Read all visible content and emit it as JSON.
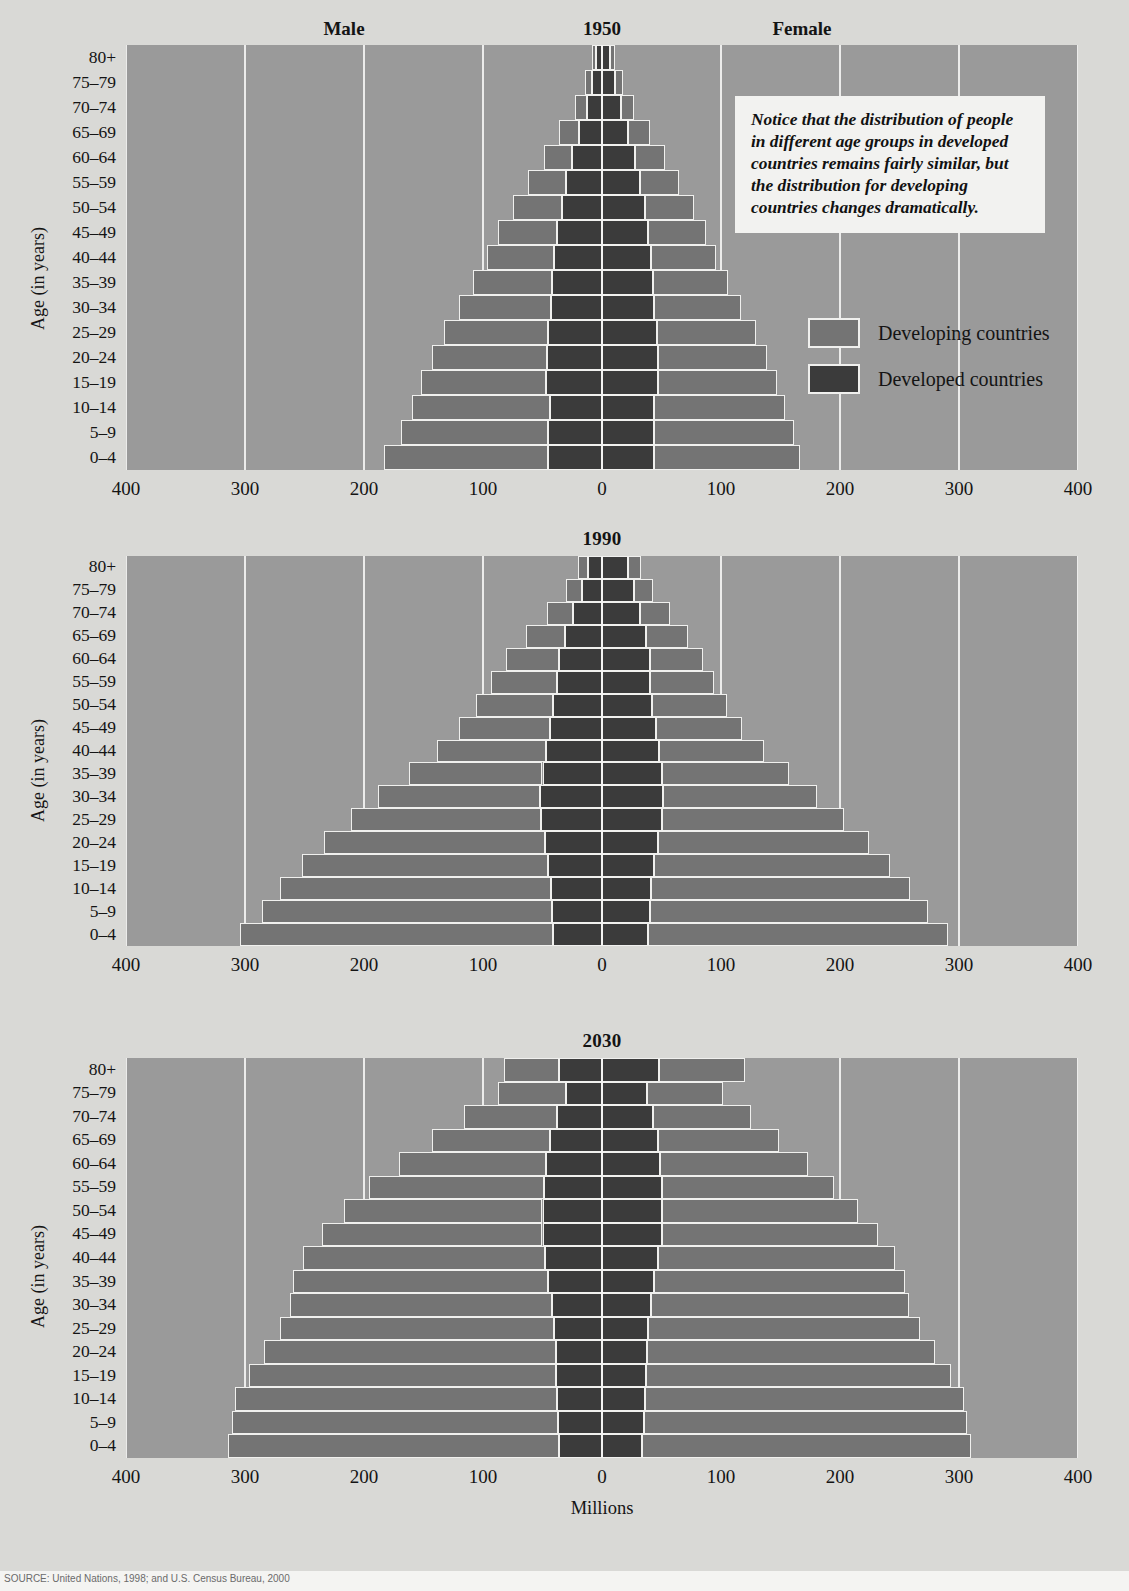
{
  "header": {
    "male_label": "Male",
    "female_label": "Female",
    "center_title": "1950"
  },
  "axis": {
    "y_title": "Age (in years)",
    "x_title": "Millions",
    "x_ticks": [
      "400",
      "300",
      "200",
      "100",
      "0",
      "100",
      "200",
      "300",
      "400"
    ],
    "x_tick_values": [
      -400,
      -300,
      -200,
      -100,
      0,
      100,
      200,
      300,
      400
    ],
    "age_groups": [
      "80+",
      "75–79",
      "70–74",
      "65–69",
      "60–64",
      "55–59",
      "50–54",
      "45–49",
      "40–44",
      "35–39",
      "30–34",
      "25–29",
      "20–24",
      "15–19",
      "10–14",
      "5–9",
      "0–4"
    ]
  },
  "annotation": {
    "text": "Notice that the distribution of people in different age groups in developed countries remains fairly similar, but the distribution for developing countries changes dramatically."
  },
  "legend": {
    "position": "inside-upper-right",
    "items": [
      {
        "label": "Developing countries",
        "color": "#747474",
        "key": "developing"
      },
      {
        "label": "Developed countries",
        "color": "#3b3b3b",
        "key": "developed"
      }
    ]
  },
  "source": {
    "text": "SOURCE: United Nations, 1998; and U.S. Census Bureau, 2000"
  },
  "colors": {
    "background": "#d9d9d6",
    "plot_background": "#9a9a9a",
    "gridline": "#ececeb",
    "developing": "#747474",
    "developed": "#3b3b3b",
    "bar_border": "#f0f0ee",
    "annotation_background": "#f2f2f0"
  },
  "panel_titles": {
    "p1950": "1950",
    "p1990": "1990",
    "p2030": "2030"
  },
  "chart_data": [
    {
      "type": "bar",
      "subtype": "population-pyramid",
      "title": "1950",
      "xlabel": "Millions",
      "ylabel": "Age (in years)",
      "xlim": [
        -400,
        400
      ],
      "xticks": [
        -400,
        -300,
        -200,
        -100,
        0,
        100,
        200,
        300,
        400
      ],
      "xticklabels": [
        "400",
        "300",
        "200",
        "100",
        "0",
        "100",
        "200",
        "300",
        "400"
      ],
      "grid": true,
      "legend": [
        "Developing countries",
        "Developed countries"
      ],
      "legend_position": "inside-upper-right",
      "categories": [
        "80+",
        "75–79",
        "70–74",
        "65–69",
        "60–64",
        "55–59",
        "50–54",
        "45–49",
        "40–44",
        "35–39",
        "30–34",
        "25–29",
        "20–24",
        "15–19",
        "10–14",
        "5–9",
        "0–4"
      ],
      "series": [
        {
          "name": "Male developed",
          "side": "left",
          "group": "developed",
          "values": [
            5,
            8,
            13,
            19,
            25,
            30,
            34,
            38,
            40,
            42,
            43,
            45,
            46,
            47,
            44,
            45,
            45
          ]
        },
        {
          "name": "Male developing",
          "side": "left",
          "group": "developing",
          "values": [
            3,
            6,
            10,
            17,
            24,
            32,
            41,
            49,
            57,
            66,
            77,
            88,
            97,
            105,
            116,
            124,
            138
          ]
        },
        {
          "name": "Female developed",
          "side": "right",
          "group": "developed",
          "values": [
            7,
            11,
            16,
            22,
            28,
            32,
            36,
            39,
            41,
            43,
            44,
            46,
            47,
            47,
            44,
            44,
            44
          ]
        },
        {
          "name": "Female developing",
          "side": "right",
          "group": "developing",
          "values": [
            4,
            7,
            11,
            18,
            25,
            33,
            41,
            48,
            55,
            63,
            73,
            83,
            92,
            100,
            110,
            117,
            122
          ]
        }
      ],
      "male_totals": [
        8,
        14,
        23,
        36,
        49,
        62,
        75,
        87,
        97,
        108,
        120,
        133,
        143,
        152,
        160,
        169,
        183
      ],
      "female_totals": [
        11,
        18,
        27,
        40,
        53,
        65,
        77,
        87,
        96,
        106,
        117,
        129,
        139,
        147,
        154,
        161,
        166
      ]
    },
    {
      "type": "bar",
      "subtype": "population-pyramid",
      "title": "1990",
      "xlabel": "Millions",
      "ylabel": "Age (in years)",
      "xlim": [
        -400,
        400
      ],
      "xticks": [
        -400,
        -300,
        -200,
        -100,
        0,
        100,
        200,
        300,
        400
      ],
      "xticklabels": [
        "400",
        "300",
        "200",
        "100",
        "0",
        "100",
        "200",
        "300",
        "400"
      ],
      "grid": true,
      "categories": [
        "80+",
        "75–79",
        "70–74",
        "65–69",
        "60–64",
        "55–59",
        "50–54",
        "45–49",
        "40–44",
        "35–39",
        "30–34",
        "25–29",
        "20–24",
        "15–19",
        "10–14",
        "5–9",
        "0–4"
      ],
      "series": [
        {
          "name": "Male developed",
          "side": "left",
          "group": "developed",
          "values": [
            12,
            17,
            24,
            31,
            36,
            38,
            41,
            44,
            47,
            50,
            52,
            51,
            48,
            45,
            43,
            42,
            41
          ]
        },
        {
          "name": "Male developing",
          "side": "left",
          "group": "developing",
          "values": [
            8,
            13,
            22,
            33,
            45,
            55,
            65,
            76,
            92,
            112,
            136,
            160,
            186,
            207,
            228,
            244,
            263
          ]
        },
        {
          "name": "Female developed",
          "side": "right",
          "group": "developed",
          "values": [
            22,
            27,
            32,
            37,
            40,
            40,
            42,
            45,
            48,
            50,
            51,
            50,
            47,
            44,
            41,
            40,
            39
          ]
        },
        {
          "name": "Female developing",
          "side": "right",
          "group": "developing",
          "values": [
            11,
            16,
            25,
            35,
            45,
            54,
            63,
            73,
            88,
            107,
            130,
            153,
            177,
            198,
            218,
            234,
            252
          ]
        }
      ],
      "male_totals": [
        20,
        30,
        46,
        64,
        81,
        93,
        106,
        120,
        139,
        162,
        188,
        211,
        234,
        252,
        271,
        286,
        304
      ],
      "female_totals": [
        33,
        43,
        57,
        72,
        85,
        94,
        105,
        118,
        136,
        157,
        181,
        203,
        224,
        242,
        259,
        274,
        291
      ]
    },
    {
      "type": "bar",
      "subtype": "population-pyramid",
      "title": "2030",
      "xlabel": "Millions",
      "ylabel": "Age (in years)",
      "xlim": [
        -400,
        400
      ],
      "xticks": [
        -400,
        -300,
        -200,
        -100,
        0,
        100,
        200,
        300,
        400
      ],
      "xticklabels": [
        "400",
        "300",
        "200",
        "100",
        "0",
        "100",
        "200",
        "300",
        "400"
      ],
      "grid": true,
      "categories": [
        "80+",
        "75–79",
        "70–74",
        "65–69",
        "60–64",
        "55–59",
        "50–54",
        "45–49",
        "40–44",
        "35–39",
        "30–34",
        "25–29",
        "20–24",
        "15–19",
        "10–14",
        "5–9",
        "0–4"
      ],
      "series": [
        {
          "name": "Male developed",
          "side": "left",
          "group": "developed",
          "values": [
            36,
            30,
            38,
            44,
            47,
            49,
            50,
            50,
            48,
            45,
            42,
            40,
            39,
            39,
            38,
            37,
            36
          ]
        },
        {
          "name": "Male developing",
          "side": "left",
          "group": "developing",
          "values": [
            46,
            57,
            78,
            99,
            124,
            147,
            167,
            185,
            203,
            215,
            220,
            231,
            245,
            258,
            270,
            274,
            278
          ]
        },
        {
          "name": "Female developed",
          "side": "right",
          "group": "developed",
          "values": [
            48,
            38,
            43,
            47,
            49,
            50,
            50,
            50,
            47,
            44,
            41,
            39,
            38,
            37,
            36,
            35,
            34
          ]
        },
        {
          "name": "Female developing",
          "side": "right",
          "group": "developing",
          "values": [
            72,
            64,
            82,
            102,
            124,
            145,
            165,
            182,
            199,
            211,
            217,
            228,
            242,
            256,
            268,
            272,
            276
          ]
        }
      ],
      "male_totals": [
        82,
        87,
        116,
        143,
        171,
        196,
        217,
        235,
        251,
        260,
        262,
        271,
        284,
        297,
        308,
        311,
        314
      ],
      "female_totals": [
        120,
        102,
        125,
        149,
        173,
        195,
        215,
        232,
        246,
        255,
        258,
        267,
        280,
        293,
        304,
        307,
        310
      ]
    }
  ]
}
